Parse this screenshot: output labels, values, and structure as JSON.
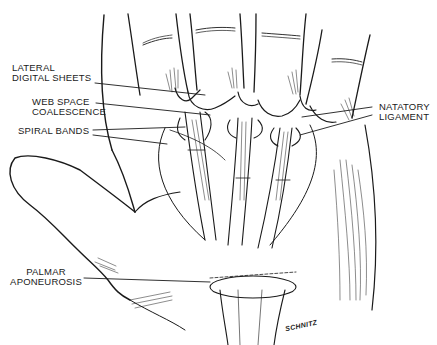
{
  "diagram": {
    "labels": [
      {
        "id": "lateral-digital-sheets",
        "lines": [
          "LATERAL",
          "DIGITAL SHEETS"
        ]
      },
      {
        "id": "web-space-coalescence",
        "lines": [
          "WEB SPACE",
          "COALESCENCE"
        ]
      },
      {
        "id": "spiral-bands",
        "lines": [
          "SPIRAL BANDS"
        ]
      },
      {
        "id": "natatory-ligament",
        "lines": [
          "NATATORY",
          "LIGAMENT"
        ]
      },
      {
        "id": "palmar-aponeurosis",
        "lines": [
          "PALMAR",
          "APONEUROSIS"
        ]
      }
    ],
    "signature": "SCHNITZ",
    "colors": {
      "ink": "#1a1a1a",
      "background": "#ffffff"
    }
  }
}
